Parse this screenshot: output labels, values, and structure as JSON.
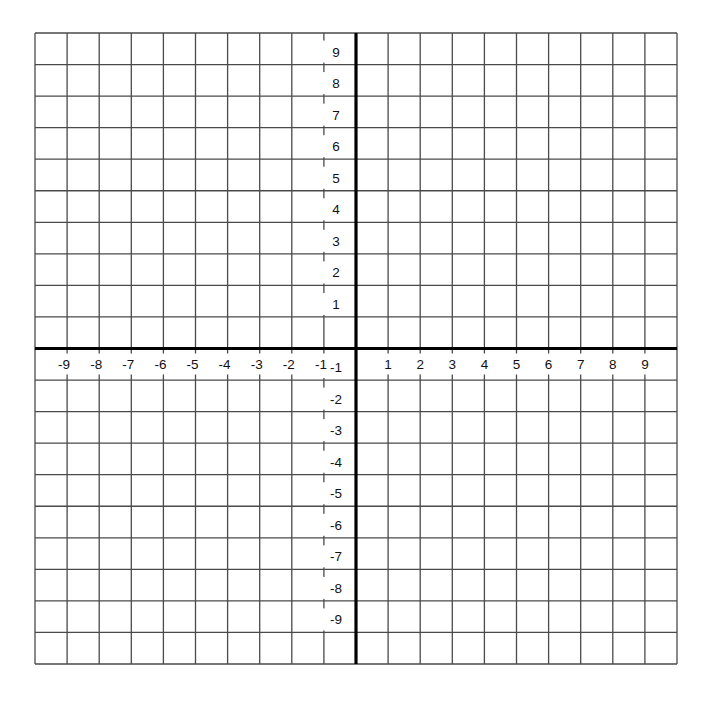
{
  "figure": {
    "type": "coordinate-plane",
    "x_range": [
      -10,
      10
    ],
    "y_range": [
      -10,
      10
    ],
    "grid_step": 1,
    "x_tick_labels": [
      "-9",
      "-8",
      "-7",
      "-6",
      "-5",
      "-4",
      "-3",
      "-2",
      "-1",
      "1",
      "2",
      "3",
      "4",
      "5",
      "6",
      "7",
      "8",
      "9"
    ],
    "y_tick_labels": [
      "9",
      "8",
      "7",
      "6",
      "5",
      "4",
      "3",
      "2",
      "1",
      "-1",
      "-2",
      "-3",
      "-4",
      "-5",
      "-6",
      "-7",
      "-8",
      "-9"
    ],
    "colors": {
      "grid": "#4a4a4a",
      "axes": "#000000",
      "background": "#ffffff",
      "text": "#111111"
    }
  },
  "layout": {
    "left": 35,
    "top": 33,
    "right": 677,
    "bottom": 664,
    "cols": 20,
    "rows": 20
  }
}
